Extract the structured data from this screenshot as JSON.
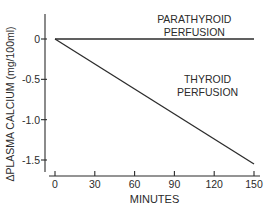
{
  "chart_data": {
    "type": "line",
    "title": "",
    "xlabel": "MINUTES",
    "ylabel": "ΔPLASMA CALCIUM (mg/100ml)",
    "xlim": [
      0,
      150
    ],
    "ylim": [
      -1.6,
      0.3
    ],
    "x_ticks": [
      0,
      30,
      60,
      90,
      120,
      150
    ],
    "x_tick_labels": [
      "0",
      "30",
      "60",
      "90",
      "120",
      "150"
    ],
    "y_ticks": [
      0,
      -0.5,
      -1.0,
      -1.5
    ],
    "y_tick_labels": [
      "0",
      "-0.5",
      "-1.0",
      "-1.5"
    ],
    "grid": false,
    "legend": "none",
    "series": [
      {
        "name": "Parathyroid perfusion",
        "x": [
          0,
          150
        ],
        "y": [
          0,
          0
        ]
      },
      {
        "name": "Thyroid perfusion",
        "x": [
          0,
          150
        ],
        "y": [
          0,
          -1.55
        ]
      }
    ],
    "annotations": [
      {
        "lines": [
          "PARATHYROID",
          "PERFUSION"
        ],
        "series": "Parathyroid perfusion",
        "x": 105,
        "y": 0.2
      },
      {
        "lines": [
          "THYROID",
          "PERFUSION"
        ],
        "series": "Thyroid perfusion",
        "x": 115,
        "y": -0.55
      }
    ]
  }
}
